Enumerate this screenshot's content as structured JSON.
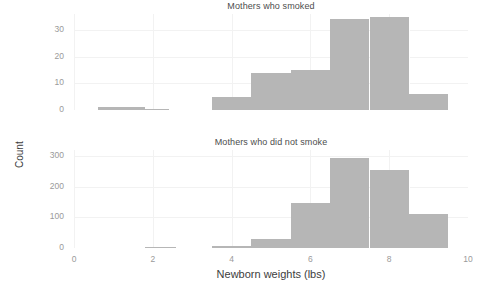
{
  "chart_data": {
    "type": "bar",
    "title": "",
    "xlabel": "Newborn weights (lbs)",
    "ylabel": "Count",
    "xlim": [
      0,
      10
    ],
    "xticks": [
      0,
      2,
      4,
      6,
      8,
      10
    ],
    "xtick_labels": [
      "0",
      "2",
      "4",
      "6",
      "8",
      "10"
    ],
    "grid": true,
    "legend": "none",
    "panels": [
      {
        "facet_label": "Mothers who smoked",
        "ylim": [
          0,
          36
        ],
        "yticks": [
          0,
          10,
          20,
          30
        ],
        "ytick_labels": [
          "0",
          "10",
          "20",
          "30"
        ],
        "bin_width": 1,
        "bins": [
          {
            "x0": 0.6,
            "x1": 1.8,
            "value": 1
          },
          {
            "x0": 1.8,
            "x1": 2.4,
            "value": 0.4
          },
          {
            "x0": 3.5,
            "x1": 4.5,
            "value": 5
          },
          {
            "x0": 4.5,
            "x1": 5.5,
            "value": 14
          },
          {
            "x0": 5.5,
            "x1": 6.5,
            "value": 15
          },
          {
            "x0": 6.5,
            "x1": 7.5,
            "value": 34
          },
          {
            "x0": 7.5,
            "x1": 8.5,
            "value": 35
          },
          {
            "x0": 8.5,
            "x1": 9.5,
            "value": 6
          }
        ]
      },
      {
        "facet_label": "Mothers who did not smoke",
        "ylim": [
          0,
          320
        ],
        "yticks": [
          0,
          100,
          200,
          300
        ],
        "ytick_labels": [
          "0",
          "100",
          "200",
          "300"
        ],
        "bin_width": 1,
        "bins": [
          {
            "x0": 1.8,
            "x1": 2.6,
            "value": 1
          },
          {
            "x0": 3.5,
            "x1": 4.5,
            "value": 5
          },
          {
            "x0": 4.5,
            "x1": 5.5,
            "value": 30
          },
          {
            "x0": 5.5,
            "x1": 6.5,
            "value": 147
          },
          {
            "x0": 6.5,
            "x1": 7.5,
            "value": 293
          },
          {
            "x0": 7.5,
            "x1": 8.5,
            "value": 255
          },
          {
            "x0": 8.5,
            "x1": 9.5,
            "value": 112
          }
        ]
      }
    ],
    "colors": {
      "bar_fill": "#b6b6b6",
      "grid_major": "#f2f2f2",
      "panel_background": "#ffffff",
      "tick_text": "#9a9a9a",
      "title_text": "#4d4d4d",
      "axis_label_text": "#3d3d3d"
    }
  }
}
